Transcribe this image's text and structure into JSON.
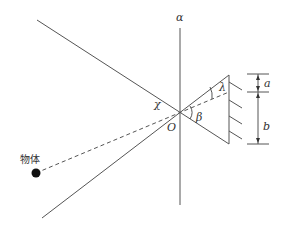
{
  "diagram": {
    "labels": {
      "axis": "α",
      "angle_chi": "χ",
      "origin": "O",
      "angle_beta": "β",
      "angle_lambda": "λ",
      "dim_a": "a",
      "dim_b": "b",
      "object": "物体"
    },
    "colors": {
      "line": "#555555",
      "text": "#333333",
      "dot": "#111111"
    }
  }
}
